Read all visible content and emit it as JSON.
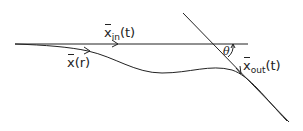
{
  "diagram": {
    "colors": {
      "stroke": "#222222",
      "background": "#ffffff"
    },
    "labels": {
      "incoming": {
        "symbol": "x",
        "subscript": "in",
        "argument": "(t)"
      },
      "trajectory": {
        "symbol": "x",
        "argument": "(r)"
      },
      "outgoing": {
        "symbol": "x",
        "subscript": "out",
        "argument": "(t)"
      },
      "angle": "θ"
    },
    "elements": [
      {
        "name": "incoming-line",
        "type": "line",
        "from": [
          15,
          44
        ],
        "to": [
          248,
          44
        ]
      },
      {
        "name": "outgoing-line",
        "type": "line",
        "from": [
          183,
          13
        ],
        "to": [
          289,
          122
        ]
      },
      {
        "name": "trajectory-curve",
        "type": "curve",
        "points": [
          [
            15,
            44
          ],
          [
            88,
            51
          ],
          [
            160,
            73
          ],
          [
            225,
            68
          ],
          [
            289,
            122
          ]
        ]
      },
      {
        "name": "angle-arc",
        "type": "arc",
        "center": [
          219,
          44
        ],
        "label": "θ"
      }
    ]
  }
}
